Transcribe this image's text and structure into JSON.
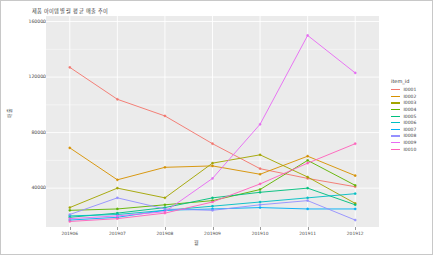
{
  "chart_data": {
    "type": "line",
    "title": "제품 아이템별 월 평균 매출 추이",
    "xlabel": "월",
    "ylabel": "매출",
    "grid": true,
    "legend_position": "right",
    "legend_title": "item_id",
    "categories": [
      "201906",
      "201907",
      "201908",
      "201909",
      "201910",
      "201911",
      "201912"
    ],
    "ylim": [
      12000,
      164000
    ],
    "yticks": [
      40000,
      80000,
      120000,
      160000
    ],
    "ytick_labels": [
      "40000",
      "80000",
      "120000",
      "160000"
    ],
    "series": [
      {
        "name": "I0001",
        "color": "#f3766e",
        "values": [
          127000,
          104000,
          92000,
          72000,
          54000,
          47000,
          41000
        ]
      },
      {
        "name": "I0002",
        "color": "#d79100",
        "values": [
          69000,
          46000,
          55000,
          56000,
          50000,
          63000,
          49000
        ]
      },
      {
        "name": "I0003",
        "color": "#a3a500",
        "values": [
          26000,
          40000,
          33000,
          58000,
          64000,
          48000,
          29000
        ]
      },
      {
        "name": "I0004",
        "color": "#5fb300",
        "values": [
          24000,
          25000,
          28000,
          31000,
          39000,
          60000,
          42000
        ]
      },
      {
        "name": "I0005",
        "color": "#00bf7d",
        "values": [
          19000,
          22000,
          26000,
          33000,
          37000,
          40000,
          28000
        ]
      },
      {
        "name": "I0006",
        "color": "#00bfc4",
        "values": [
          20000,
          21000,
          24000,
          27000,
          30000,
          33000,
          36000
        ]
      },
      {
        "name": "I0007",
        "color": "#00b0f6",
        "values": [
          17000,
          19000,
          24000,
          25000,
          26000,
          25000,
          25000
        ]
      },
      {
        "name": "I0008",
        "color": "#9590ff",
        "values": [
          21000,
          33000,
          25000,
          24000,
          28000,
          31000,
          17000
        ]
      },
      {
        "name": "I0009",
        "color": "#e76bf3",
        "values": [
          18000,
          20000,
          23000,
          47000,
          86000,
          150000,
          123000
        ]
      },
      {
        "name": "I0010",
        "color": "#ff62bc",
        "values": [
          16000,
          18000,
          22000,
          30000,
          43000,
          58000,
          72000
        ]
      }
    ]
  }
}
